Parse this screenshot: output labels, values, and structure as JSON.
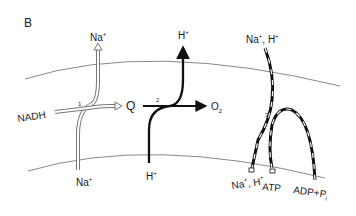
{
  "panel_label": "B",
  "membrane": {
    "color": "#8a8a8a"
  },
  "pathways": [
    {
      "id": "1",
      "number_label": "1",
      "style": "hollow double-line arrow",
      "inputs": [
        "NADH",
        "Na+ (inside)"
      ],
      "outputs": [
        "Q",
        "Na+ (outside)"
      ]
    },
    {
      "id": "2",
      "number_label": "2",
      "style": "solid black arrow",
      "inputs": [
        "Q",
        "H+ (inside)"
      ],
      "outputs": [
        "O2",
        "H+ (outside)"
      ]
    },
    {
      "id": "3",
      "number_label": "3",
      "style": "dashed black/white arrow",
      "inputs": [
        "Na+, H+ (outside)",
        "ADP + Pi"
      ],
      "outputs": [
        "Na+, H+ (inside)",
        "ATP"
      ]
    }
  ],
  "labels": {
    "na_top": "Na",
    "na_bottom": "Na",
    "nadh": "NADH",
    "q": "Q",
    "h_top": "H",
    "h_bottom": "H",
    "o": "O",
    "o_sub": "2",
    "na_h_top": "Na",
    "na_h_top_h": "H",
    "na_h_bottom": "Na",
    "na_h_bottom_h": "H",
    "atp": "ATP",
    "adp": "ADP+P",
    "adp_sub": "i",
    "plus": "+",
    "num1": "1",
    "num2": "2",
    "num3": "3"
  }
}
